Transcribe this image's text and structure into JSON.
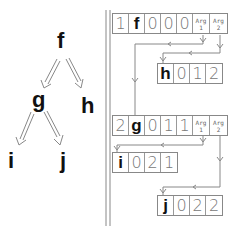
{
  "tree": {
    "nodes": [
      {
        "id": "f",
        "label": "f"
      },
      {
        "id": "g",
        "label": "g"
      },
      {
        "id": "h",
        "label": "h"
      },
      {
        "id": "i",
        "label": "i"
      },
      {
        "id": "j",
        "label": "j"
      }
    ],
    "edges": [
      [
        "f",
        "g"
      ],
      [
        "f",
        "h"
      ],
      [
        "g",
        "i"
      ],
      [
        "g",
        "j"
      ]
    ]
  },
  "records": {
    "f": {
      "index": "1",
      "name": "f",
      "fields": [
        "0",
        "0",
        "0"
      ],
      "arg1": [
        "Arg",
        "1"
      ],
      "arg2": [
        "Arg",
        "2"
      ]
    },
    "h": {
      "name": "h",
      "fields": [
        "0",
        "1",
        "2"
      ]
    },
    "g": {
      "index": "2",
      "name": "g",
      "fields": [
        "0",
        "1",
        "1"
      ],
      "arg1": [
        "Arg",
        "1"
      ],
      "arg2": [
        "Arg",
        "2"
      ]
    },
    "i": {
      "name": "i",
      "fields": [
        "0",
        "2",
        "1"
      ]
    },
    "j": {
      "name": "j",
      "fields": [
        "0",
        "2",
        "2"
      ]
    }
  },
  "colors": {
    "line": "#888888",
    "text": "#111111",
    "cell_text": "#777777"
  }
}
